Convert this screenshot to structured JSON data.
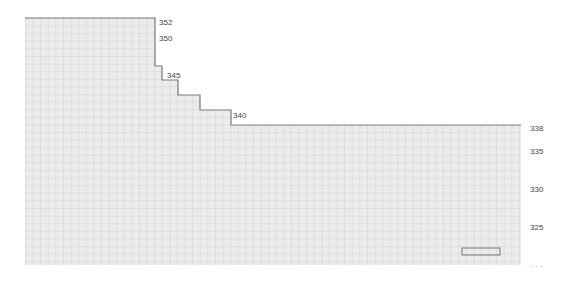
{
  "diagram": {
    "type": "knitting-chart",
    "cell_width": 7.6,
    "cell_height": 7.6,
    "grid_color": "#c9c9c9",
    "fill_color": "#ececec",
    "outline_color": "#777777",
    "outline": [
      [
        25,
        18
      ],
      [
        155,
        18
      ],
      [
        155,
        66
      ],
      [
        162,
        66
      ],
      [
        162,
        80
      ],
      [
        178,
        80
      ],
      [
        178,
        95
      ],
      [
        200,
        95
      ],
      [
        200,
        110
      ],
      [
        231,
        110
      ],
      [
        231,
        125
      ],
      [
        521,
        125
      ],
      [
        521,
        265
      ],
      [
        25,
        265
      ]
    ],
    "highlight_box": {
      "x": 462,
      "y": 248,
      "w": 38,
      "h": 7
    }
  },
  "row_labels": [
    {
      "text": "352",
      "x": 159,
      "y": 19
    },
    {
      "text": "350",
      "x": 159,
      "y": 35
    },
    {
      "text": "345",
      "x": 167,
      "y": 72
    },
    {
      "text": "340",
      "x": 233,
      "y": 112
    },
    {
      "text": "338",
      "x": 530,
      "y": 125
    },
    {
      "text": "335",
      "x": 530,
      "y": 148
    },
    {
      "text": "330",
      "x": 530,
      "y": 186
    },
    {
      "text": "325",
      "x": 530,
      "y": 224
    }
  ],
  "cut_label": {
    "text": "· · ·",
    "x": 530,
    "y": 263
  }
}
